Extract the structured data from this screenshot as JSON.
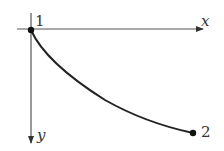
{
  "diagram": {
    "type": "curve-between-points",
    "colors": {
      "axis": "#555555",
      "curve": "#222222",
      "point": "#111111",
      "label": "#333333",
      "background": "#ffffff"
    },
    "axes": {
      "x": {
        "label": "x",
        "direction": "right"
      },
      "y": {
        "label": "y",
        "direction": "down"
      }
    },
    "points": [
      {
        "id": "1",
        "label": "1",
        "position": "origin"
      },
      {
        "id": "2",
        "label": "2",
        "position": "bottom-right"
      }
    ],
    "curve": {
      "from": "1",
      "to": "2",
      "shape": "concave, steep at start, flattening toward end"
    }
  }
}
